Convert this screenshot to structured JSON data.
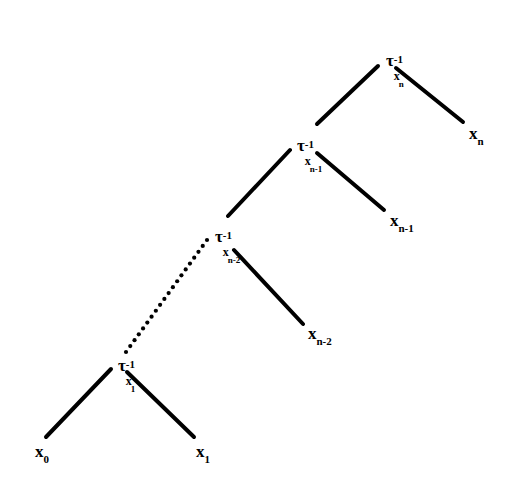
{
  "diagram": {
    "type": "binary-tree",
    "background_color": "#ffffff",
    "stroke_color": "#000000",
    "nodes": [
      {
        "id": "tau-n",
        "role": "internal",
        "label": "τ",
        "superscript": "-1",
        "subscript": "x",
        "subsubscript": "n",
        "x": 386,
        "y": 52
      },
      {
        "id": "tau-n-1",
        "role": "internal",
        "label": "τ",
        "superscript": "-1",
        "subscript": "x",
        "subsubscript": "n-1",
        "x": 297,
        "y": 137
      },
      {
        "id": "tau-n-2",
        "role": "internal",
        "label": "τ",
        "superscript": "-1",
        "subscript": "x",
        "subsubscript": "n-2",
        "x": 215,
        "y": 228
      },
      {
        "id": "tau-1",
        "role": "internal",
        "label": "τ",
        "superscript": "-1",
        "subscript": "x",
        "subsubscript": "1",
        "x": 118,
        "y": 357
      },
      {
        "id": "leaf-xn",
        "role": "leaf",
        "label": "x",
        "subscript": "n",
        "x": 469,
        "y": 125
      },
      {
        "id": "leaf-xn-1",
        "role": "leaf",
        "label": "x",
        "subscript": "n-1",
        "x": 390,
        "y": 212
      },
      {
        "id": "leaf-xn-2",
        "role": "leaf",
        "label": "x",
        "subscript": "n-2",
        "x": 308,
        "y": 325
      },
      {
        "id": "leaf-x1",
        "role": "leaf",
        "label": "x",
        "subscript": "1",
        "x": 196,
        "y": 443
      },
      {
        "id": "leaf-x0",
        "role": "leaf",
        "label": "x",
        "subscript": "0",
        "x": 35,
        "y": 443
      }
    ],
    "edges": [
      {
        "id": "edge-tau-n-to-tau-n-1",
        "from": "tau-n",
        "to": "tau-n-1",
        "style": "solid",
        "x1": 378,
        "y1": 66,
        "x2": 317,
        "y2": 124
      },
      {
        "id": "edge-tau-n-to-leaf-xn",
        "from": "tau-n",
        "to": "leaf-xn",
        "style": "solid",
        "x1": 396,
        "y1": 68,
        "x2": 463,
        "y2": 122
      },
      {
        "id": "edge-tau-n-1-to-tau-n-2",
        "from": "tau-n-1",
        "to": "tau-n-2",
        "style": "solid",
        "x1": 290,
        "y1": 150,
        "x2": 228,
        "y2": 216
      },
      {
        "id": "edge-tau-n-1-to-leaf-xn-1",
        "from": "tau-n-1",
        "to": "leaf-xn-1",
        "style": "solid",
        "x1": 317,
        "y1": 153,
        "x2": 384,
        "y2": 210
      },
      {
        "id": "edge-tau-n-2-to-tau-1",
        "from": "tau-n-2",
        "to": "tau-1",
        "style": "dotted",
        "x1": 207,
        "y1": 240,
        "x2": 126,
        "y2": 352
      },
      {
        "id": "edge-tau-n-2-to-leaf-xn-2",
        "from": "tau-n-2",
        "to": "leaf-xn-2",
        "style": "solid",
        "x1": 234,
        "y1": 250,
        "x2": 303,
        "y2": 324
      },
      {
        "id": "edge-tau-1-to-leaf-x0",
        "from": "tau-1",
        "to": "leaf-x0",
        "style": "solid",
        "x1": 111,
        "y1": 369,
        "x2": 46,
        "y2": 437
      },
      {
        "id": "edge-tau-1-to-leaf-x1",
        "from": "tau-1",
        "to": "leaf-x1",
        "style": "solid",
        "x1": 127,
        "y1": 372,
        "x2": 194,
        "y2": 437
      }
    ]
  }
}
